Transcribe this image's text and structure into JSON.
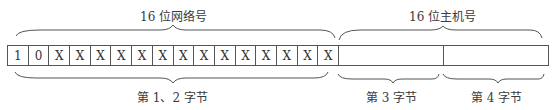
{
  "diagram": {
    "top_labels": {
      "network": "16 位网络号",
      "host": "16 位主机号"
    },
    "bits": [
      "1",
      "0",
      "X",
      "X",
      "X",
      "X",
      "X",
      "X",
      "X",
      "X",
      "X",
      "X",
      "X",
      "X",
      "X",
      "X"
    ],
    "bottom_labels": {
      "bytes12": "第 1、2 字节",
      "byte3": "第 3 字节",
      "byte4": "第 4 字节"
    },
    "colors": {
      "line": "#555555",
      "text": "#333333",
      "background": "#ffffff"
    }
  }
}
